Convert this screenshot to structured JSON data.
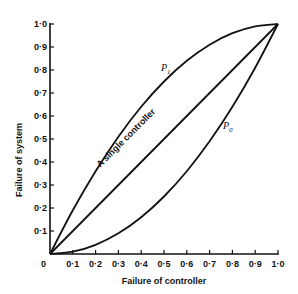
{
  "chart_data": {
    "type": "line",
    "title": "",
    "xlabel": "Failure of controller",
    "ylabel": "Failure of system",
    "xlim": [
      0,
      1.0
    ],
    "ylim": [
      0,
      1.0
    ],
    "grid": false,
    "x_ticks": [
      "0",
      "0·1",
      "0·2",
      "0·3",
      "0·4",
      "0·5",
      "0·6",
      "0·7",
      "0·8",
      "0·9",
      "1·0"
    ],
    "y_ticks": [
      "0·1",
      "0·2",
      "0·3",
      "0·4",
      "0·5",
      "0·6",
      "0·7",
      "0·8",
      "0·9",
      "1·0"
    ],
    "origin_label": "0",
    "series": [
      {
        "name": "P1",
        "label_main": "P",
        "label_sub": "1",
        "x": [
          0,
          0.1,
          0.2,
          0.3,
          0.4,
          0.5,
          0.6,
          0.7,
          0.8,
          0.9,
          1.0
        ],
        "y": [
          0,
          0.19,
          0.36,
          0.51,
          0.64,
          0.75,
          0.84,
          0.91,
          0.96,
          0.99,
          1.0
        ]
      },
      {
        "name": "A single controller",
        "x": [
          0,
          1.0
        ],
        "y": [
          0,
          1.0
        ]
      },
      {
        "name": "P0",
        "label_main": "P",
        "label_sub": "0",
        "x": [
          0,
          0.1,
          0.2,
          0.3,
          0.4,
          0.5,
          0.6,
          0.7,
          0.8,
          0.9,
          1.0
        ],
        "y": [
          0,
          0.01,
          0.04,
          0.09,
          0.16,
          0.25,
          0.36,
          0.49,
          0.64,
          0.81,
          1.0
        ]
      }
    ],
    "annotations": [
      "A single controller",
      "P1",
      "P0"
    ]
  }
}
